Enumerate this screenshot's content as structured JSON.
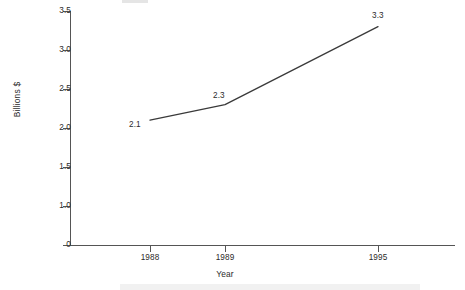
{
  "chart_data": {
    "type": "line",
    "title": "",
    "xlabel": "Year",
    "ylabel": "Billions $",
    "categories": [
      "1988",
      "1989",
      "1995"
    ],
    "x": [
      1988,
      1989,
      1995
    ],
    "values": [
      2.1,
      2.3,
      3.3
    ],
    "point_labels": [
      "2.1",
      "2.3",
      "3.3"
    ],
    "series": [
      {
        "name": "",
        "values": [
          2.1,
          2.3,
          3.3
        ]
      }
    ],
    "ylim": [
      0,
      3.5
    ],
    "ytick_labels": [
      "3.5",
      "3.0",
      "2.5",
      "2.0",
      "1.5",
      "1.0",
      "0"
    ],
    "ytick_values": [
      3.5,
      3.0,
      2.5,
      2.0,
      1.5,
      1.0,
      0
    ],
    "xtick_labels": [
      "1988",
      "1989",
      "1995"
    ],
    "grid": false,
    "legend": false,
    "line_color": "#3a3a3a",
    "axis_color": "#555555",
    "background_color": "#ffffff"
  },
  "axes": {
    "y_title": "Billions $",
    "x_title": "Year",
    "y_ticks": [
      {
        "label": "3.5"
      },
      {
        "label": "3.0"
      },
      {
        "label": "2.5"
      },
      {
        "label": "2.0"
      },
      {
        "label": "1.5"
      },
      {
        "label": "1.0"
      },
      {
        "label": "0"
      }
    ],
    "x_ticks": [
      {
        "label": "1988"
      },
      {
        "label": "1989"
      },
      {
        "label": "1995"
      }
    ]
  },
  "data_labels": {
    "p0": "2.1",
    "p1": "2.3",
    "p2": "3.3"
  }
}
